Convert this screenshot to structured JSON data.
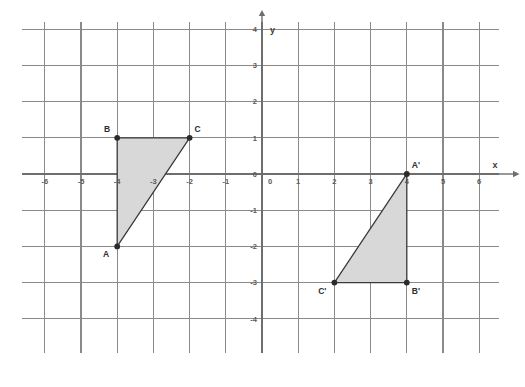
{
  "figure": {
    "background_color": "#ffffff",
    "grid_color": "#8a8a8a",
    "axis_color": "#6e6e6e",
    "shape_fill": "#d8d8d8",
    "shape_stroke": "#3a3a3a",
    "vertex_color": "#2b2b2b"
  },
  "chart_data": {
    "type": "scatter",
    "title": "",
    "xlabel": "x",
    "ylabel": "y",
    "xlim": [
      -6.5,
      6.5
    ],
    "ylim": [
      -5.5,
      4.5
    ],
    "grid": true,
    "legend": "none",
    "x_ticks": [
      -6,
      -5,
      -4,
      -3,
      -2,
      -1,
      0,
      1,
      2,
      3,
      4,
      5,
      6
    ],
    "x_tick_labels": [
      "-6",
      "-5",
      "-4",
      "-3",
      "-2",
      "-1",
      "0",
      "1",
      "2",
      "3",
      "4",
      "5",
      "6"
    ],
    "y_ticks": [
      -5,
      -4,
      -3,
      -2,
      -1,
      0,
      1,
      2,
      3,
      4
    ],
    "y_tick_labels": [
      "-5",
      "-4",
      "-3",
      "-2",
      "-1",
      "0",
      "1",
      "2",
      "3",
      "4"
    ],
    "origin_labels": [
      "0",
      "0"
    ],
    "axis_arrows": [
      "x-positive",
      "y-positive"
    ],
    "series": [
      {
        "name": "Triangle ABC",
        "type": "polygon",
        "closed": true,
        "fill": "#d8d8d8",
        "stroke": "#3a3a3a",
        "points": [
          {
            "label": "A",
            "x": -4,
            "y": -2,
            "label_position": "below-left"
          },
          {
            "label": "B",
            "x": -4,
            "y": 1,
            "label_position": "above-left"
          },
          {
            "label": "C",
            "x": -2,
            "y": 1,
            "label_position": "above-right"
          }
        ]
      },
      {
        "name": "Triangle A'B'C'",
        "type": "polygon",
        "closed": true,
        "fill": "#d8d8d8",
        "stroke": "#3a3a3a",
        "points": [
          {
            "label": "A'",
            "x": 4,
            "y": 0,
            "label_position": "above-right"
          },
          {
            "label": "B'",
            "x": 4,
            "y": -3,
            "label_position": "below-right"
          },
          {
            "label": "C'",
            "x": 2,
            "y": -3,
            "label_position": "below-left"
          }
        ]
      }
    ]
  }
}
